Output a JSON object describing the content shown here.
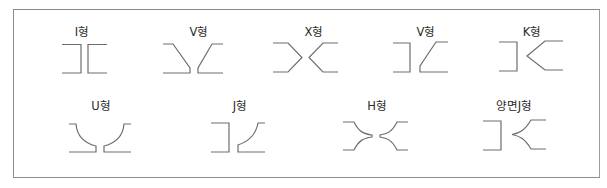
{
  "diagram": {
    "title": "",
    "kind": "groove weld shapes",
    "items": [
      {
        "label": "I형",
        "row": 1
      },
      {
        "label": "V형",
        "row": 1
      },
      {
        "label": "X형",
        "row": 1
      },
      {
        "label": "V형",
        "row": 1
      },
      {
        "label": "K형",
        "row": 1
      },
      {
        "label": "U형",
        "row": 2
      },
      {
        "label": "J형",
        "row": 2
      },
      {
        "label": "H형",
        "row": 2
      },
      {
        "label": "양면J형",
        "row": 2
      }
    ],
    "colors": {
      "line": "#6e6e6e",
      "frame": "#8a8a8a",
      "text": "#2a2a2a",
      "background": "#ffffff"
    }
  }
}
